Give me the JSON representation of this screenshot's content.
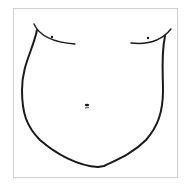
{
  "figure": {
    "frame_border_color": "#cfcfcf",
    "stroke_color": "#1a1a1a"
  }
}
